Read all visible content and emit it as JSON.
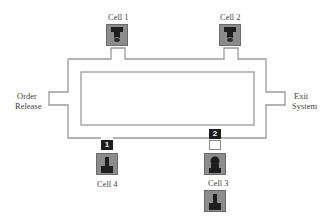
{
  "diagram": {
    "type": "manufacturing-loop-layout",
    "line_color": "#9a9a9a",
    "cell_fill": "#8c8c8c",
    "icon_color": "#1e1e1e",
    "badge_color": "#1c1c1c"
  },
  "labels": {
    "order_release": [
      "Order",
      "Release"
    ],
    "exit_system": [
      "Exit",
      "System"
    ]
  },
  "cells": [
    {
      "id": "cell1",
      "label": "Cell 1",
      "icon": "machine-tool-top-icon"
    },
    {
      "id": "cell2",
      "label": "Cell 2",
      "icon": "machine-tool-top-icon"
    },
    {
      "id": "cell3",
      "label": "Cell 3",
      "icon": "worker-icon"
    },
    {
      "id": "cell4",
      "label": "Cell 4",
      "icon": "machine-tool-bottom-icon"
    }
  ],
  "badges": [
    {
      "id": "badge-1",
      "text": "1"
    },
    {
      "id": "badge-2",
      "text": "2"
    }
  ],
  "queue_machine_icon": "machine-tool-bottom-icon"
}
